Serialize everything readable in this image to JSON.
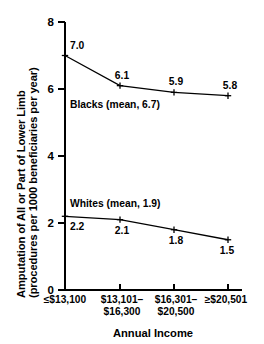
{
  "chart_data": {
    "type": "line",
    "title": "",
    "xlabel": "Annual Income",
    "ylabel_line1": "Amputation of All or Part of Lower Limb",
    "ylabel_line2": "(procedures per 1000 beneficiaries per year)",
    "categories": [
      "≤$13,100",
      "$13,101– $16,300",
      "$16,301– $20,500",
      "≥$20,501"
    ],
    "category_lines": [
      [
        "≤$13,100"
      ],
      [
        "$13,101–",
        "$16,300"
      ],
      [
        "$16,301–",
        "$20,500"
      ],
      [
        "≥$20,501"
      ]
    ],
    "ylim": [
      0,
      8
    ],
    "yticks": [
      0,
      2,
      4,
      6,
      8
    ],
    "ytick_labels": [
      "0",
      "2",
      "4",
      "6",
      "8"
    ],
    "grid": false,
    "legend_position": "inline-annotation",
    "line_color": "#000000",
    "marker": "plus",
    "series": [
      {
        "name": "Blacks",
        "mean": 6.7,
        "annotation": "Blacks (mean, 6.7)",
        "values": [
          7.0,
          6.1,
          5.9,
          5.8
        ],
        "value_labels": [
          "7.0",
          "6.1",
          "5.9",
          "5.8"
        ]
      },
      {
        "name": "Whites",
        "mean": 1.9,
        "annotation": "Whites (mean, 1.9)",
        "values": [
          2.2,
          2.1,
          1.8,
          1.5
        ],
        "value_labels": [
          "2.2",
          "2.1",
          "1.8",
          "1.5"
        ]
      }
    ]
  }
}
